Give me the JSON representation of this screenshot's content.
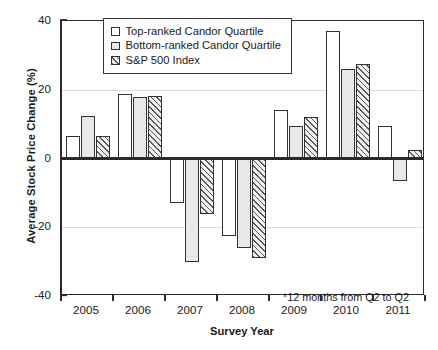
{
  "chart_data": {
    "type": "bar",
    "title": "",
    "xlabel": "Survey Year",
    "ylabel": "Average Stock Price Change (%)",
    "categories": [
      "2005",
      "2006",
      "2007",
      "2008",
      "2009",
      "2010",
      "2011"
    ],
    "series": [
      {
        "name": "Top-ranked Candor Quartile",
        "fill": "white",
        "values": [
          6.5,
          18.8,
          -13.0,
          -22.5,
          14.0,
          37.0,
          9.5
        ]
      },
      {
        "name": "Bottom-ranked Candor Quartile",
        "fill": "gray",
        "values": [
          12.5,
          18.0,
          -30.0,
          -26.0,
          9.5,
          26.0,
          -6.5
        ]
      },
      {
        "name": "S&P 500 Index",
        "fill": "hatch",
        "values": [
          6.5,
          18.3,
          -16.0,
          -29.0,
          12.0,
          27.5,
          2.5
        ]
      }
    ],
    "ylim": [
      -40,
      40
    ],
    "yticks": [
      40,
      20,
      0,
      -20,
      -40
    ],
    "gridlines": [
      20,
      -20
    ],
    "grid": true,
    "legend_position": "top-center",
    "annotations": [
      "*12 months from Q2 to Q2"
    ]
  },
  "axes": {
    "y_title": "Average Stock Price Change (%)",
    "x_title": "Survey Year"
  },
  "legend": {
    "items": [
      {
        "label": "Top-ranked Candor Quartile"
      },
      {
        "label": "Bottom-ranked Candor Quartile"
      },
      {
        "label": "S&P 500 Index"
      }
    ]
  },
  "footnote": "*12 months from Q2 to Q2",
  "colors": {
    "axis": "#2b2b2b",
    "grid": "#dcdcdc",
    "bar_outline": "#333333",
    "series_white": "#ffffff",
    "series_gray": "#e8e8e8",
    "series_hatch": "#5a5a5a"
  }
}
